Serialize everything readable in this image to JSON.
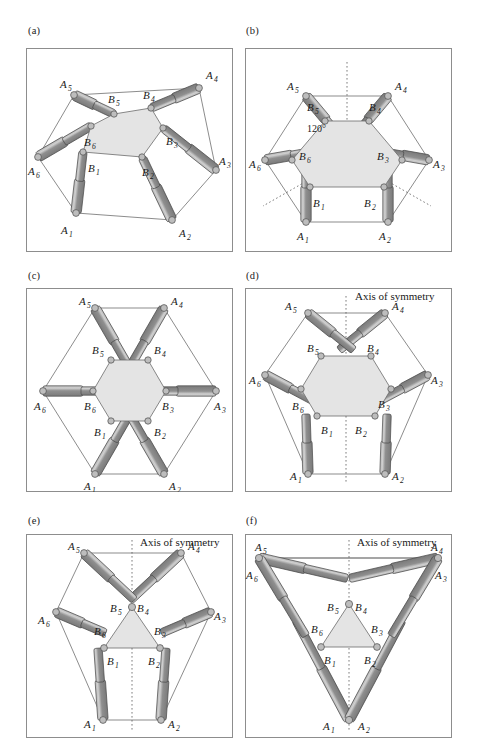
{
  "figure": {
    "panel_count": 6,
    "colors": {
      "frame_stroke": "#8d8d8d",
      "thin_line": "#5a5a5a",
      "platform_fill": "#e2e2e2",
      "platform_stroke": "#6b6b6b",
      "leg_body": "#8a8a8a",
      "leg_body_dark": "#6f6f6f",
      "leg_highlight": "#c9c9c9",
      "leg_stroke": "#4a4a4a",
      "joint_fill": "#bdbdbd",
      "joint_stroke": "#4a4a4a",
      "dashed": "#5a5a5a"
    }
  },
  "panels": [
    {
      "id": "a",
      "label": "(a)",
      "caption": "",
      "has_axis_of_symmetry": false,
      "axis_label": "",
      "has_angle": false,
      "angle_label": "",
      "base_vertex_labels": [
        "A_1",
        "A_2",
        "A_3",
        "A_4",
        "A_5",
        "A_6"
      ],
      "platform_vertex_labels": [
        "B_1",
        "B_2",
        "B_3",
        "B_4",
        "B_5",
        "B_6"
      ],
      "platform_shape": "irregular hexagon",
      "base_shape": "irregular hexagon",
      "leg_count": 6
    },
    {
      "id": "b",
      "label": "(b)",
      "caption": "",
      "has_axis_of_symmetry": false,
      "axis_label": "",
      "has_angle": true,
      "angle_label": "120°",
      "base_vertex_labels": [
        "A_1",
        "A_2",
        "A_3",
        "A_4",
        "A_5",
        "A_6"
      ],
      "platform_vertex_labels": [
        "B_1",
        "B_2",
        "B_3",
        "B_4",
        "B_5",
        "B_6"
      ],
      "platform_shape": "semi-regular hexagon",
      "base_shape": "semi-regular hexagon",
      "leg_count": 6
    },
    {
      "id": "c",
      "label": "(c)",
      "caption": "",
      "has_axis_of_symmetry": false,
      "axis_label": "",
      "has_angle": false,
      "angle_label": "",
      "base_vertex_labels": [
        "A_1",
        "A_2",
        "A_3",
        "A_4",
        "A_5",
        "A_6"
      ],
      "platform_vertex_labels": [
        "B_1",
        "B_2",
        "B_3",
        "B_4",
        "B_5",
        "B_6"
      ],
      "platform_shape": "regular hexagon",
      "base_shape": "regular hexagon",
      "leg_count": 6
    },
    {
      "id": "d",
      "label": "(d)",
      "caption": "",
      "has_axis_of_symmetry": true,
      "axis_label": "Axis of symmetry",
      "has_angle": false,
      "angle_label": "",
      "base_vertex_labels": [
        "A_1",
        "A_2",
        "A_3",
        "A_4",
        "A_5",
        "A_6"
      ],
      "platform_vertex_labels": [
        "B_1",
        "B_2",
        "B_3",
        "B_4",
        "B_5",
        "B_6"
      ],
      "platform_shape": "semi-regular hexagon",
      "base_shape": "semi-regular hexagon",
      "leg_count": 6
    },
    {
      "id": "e",
      "label": "(e)",
      "caption": "",
      "has_axis_of_symmetry": true,
      "axis_label": "Axis of symmetry",
      "has_angle": false,
      "angle_label": "",
      "base_vertex_labels": [
        "A_1",
        "A_2",
        "A_3",
        "A_4",
        "A_5",
        "A_6"
      ],
      "platform_vertex_labels": [
        "B_1",
        "B_2",
        "B_3",
        "B_4",
        "B_5",
        "B_6"
      ],
      "platform_shape": "triangle (paired platform joints)",
      "base_shape": "semi-regular hexagon",
      "leg_count": 6
    },
    {
      "id": "f",
      "label": "(f)",
      "caption": "",
      "has_axis_of_symmetry": true,
      "axis_label": "Axis of symmetry",
      "has_angle": false,
      "angle_label": "",
      "base_vertex_labels": [
        "A_1",
        "A_2",
        "A_3",
        "A_4",
        "A_5",
        "A_6"
      ],
      "platform_vertex_labels": [
        "B_1",
        "B_2",
        "B_3",
        "B_4",
        "B_5",
        "B_6"
      ],
      "platform_shape": "triangle (paired platform joints)",
      "base_shape": "triangle (paired base joints)",
      "leg_count": 6
    }
  ],
  "labels": {
    "a": "(a)",
    "b": "(b)",
    "c": "(c)",
    "d": "(d)",
    "e": "(e)",
    "f": "(f)",
    "A1": "A",
    "A2": "A",
    "A3": "A",
    "A4": "A",
    "A5": "A",
    "A6": "A",
    "B1": "B",
    "B2": "B",
    "B3": "B",
    "B4": "B",
    "B5": "B",
    "B6": "B",
    "s1": "1",
    "s2": "2",
    "s3": "3",
    "s4": "4",
    "s5": "5",
    "s6": "6",
    "axis_of_symmetry": "Axis of symmetry",
    "angle_120": "120°"
  }
}
